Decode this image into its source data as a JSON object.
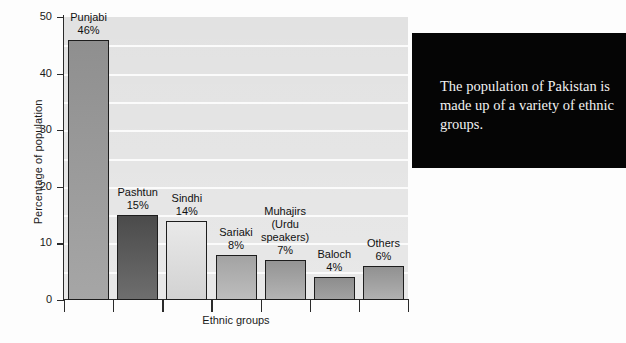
{
  "chart_data": {
    "type": "bar",
    "title": "",
    "xlabel": "Ethnic groups",
    "ylabel": "Percentage of population",
    "ylim": [
      0,
      50
    ],
    "yticks": [
      0,
      10,
      20,
      30,
      40,
      50
    ],
    "grid": true,
    "grid_step": 5,
    "legend": "none",
    "categories": [
      "Punjabi",
      "Pashtun",
      "Sindhi",
      "Sariaki",
      "Muhajirs (Urdu speakers)",
      "Baloch",
      "Others"
    ],
    "values": [
      46,
      15,
      14,
      8,
      7,
      4,
      6
    ],
    "data_labels": [
      "46%",
      "15%",
      "14%",
      "8%",
      "7%",
      "4%",
      "6%"
    ],
    "bars": [
      {
        "name": "Punjabi",
        "label": "Punjabi",
        "value_label": "46%",
        "value": 46,
        "fill_top": "#8f8f8f",
        "fill_bottom": "#a6a6a6"
      },
      {
        "name": "Pashtun",
        "label": "Pashtun",
        "value_label": "15%",
        "value": 15,
        "fill_top": "#4b4b4b",
        "fill_bottom": "#6e6e6e"
      },
      {
        "name": "Sindhi",
        "label": "Sindhi",
        "value_label": "14%",
        "value": 14,
        "fill_top": "#e9e9e9",
        "fill_bottom": "#d2d2d2"
      },
      {
        "name": "Sariaki",
        "label": "Sariaki",
        "value_label": "8%",
        "value": 8,
        "fill_top": "#a3a3a3",
        "fill_bottom": "#bdbdbd"
      },
      {
        "name": "Muhajirs",
        "label": "Muhajirs\n(Urdu\nspeakers)",
        "value_label": "7%",
        "value": 7,
        "fill_top": "#949494",
        "fill_bottom": "#b4b4b4"
      },
      {
        "name": "Baloch",
        "label": "Baloch",
        "value_label": "4%",
        "value": 4,
        "fill_top": "#8d8d8d",
        "fill_bottom": "#a2a2a2"
      },
      {
        "name": "Others",
        "label": "Others",
        "value_label": "6%",
        "value": 6,
        "fill_top": "#919191",
        "fill_bottom": "#b0b0b0"
      }
    ]
  },
  "caption": {
    "text": "The population of Pakistan is made up of a variety of ethnic groups.",
    "background": "#050505",
    "color": "#f2f2f2"
  },
  "axis": {
    "y_title": "Percentage of population",
    "x_title": "Ethnic groups",
    "y_tick_labels": [
      "50",
      "40",
      "30",
      "20",
      "10",
      "0"
    ]
  },
  "colors": {
    "plot_background": "#e2e2e2",
    "gridline": "#fbfbfb",
    "axis": "#2a2a2a",
    "bar_outline": "#1d1d1d",
    "page_background": "#fdfdfd"
  }
}
